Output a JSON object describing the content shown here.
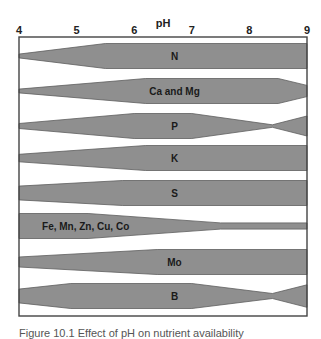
{
  "chart_data": {
    "type": "band",
    "title": "",
    "xlabel": "pH",
    "ylabel": "",
    "xlim": [
      4,
      9
    ],
    "x_ticks": [
      "4",
      "5",
      "6",
      "7",
      "8",
      "9"
    ],
    "grid": false,
    "legend": null,
    "series": [
      {
        "name": "N",
        "label_x": 6.7,
        "profile": [
          [
            4.0,
            0.15
          ],
          [
            5.5,
            1.0
          ],
          [
            9.0,
            1.0
          ]
        ]
      },
      {
        "name": "Ca and Mg",
        "label_x": 6.7,
        "profile": [
          [
            4.0,
            0.15
          ],
          [
            6.2,
            1.0
          ],
          [
            8.5,
            1.0
          ],
          [
            9.0,
            0.45
          ]
        ]
      },
      {
        "name": "P",
        "label_x": 6.7,
        "profile": [
          [
            4.0,
            0.2
          ],
          [
            6.0,
            1.0
          ],
          [
            7.0,
            1.0
          ],
          [
            8.4,
            0.1
          ],
          [
            9.0,
            0.8
          ]
        ]
      },
      {
        "name": "K",
        "label_x": 6.7,
        "profile": [
          [
            4.0,
            0.3
          ],
          [
            6.2,
            1.0
          ],
          [
            9.0,
            1.0
          ]
        ]
      },
      {
        "name": "S",
        "label_x": 6.7,
        "profile": [
          [
            4.0,
            0.55
          ],
          [
            5.8,
            1.0
          ],
          [
            9.0,
            1.0
          ]
        ]
      },
      {
        "name": "Fe, Mn, Zn, Cu, Co",
        "label_x": 4.4,
        "profile": [
          [
            4.0,
            1.0
          ],
          [
            5.2,
            1.0
          ],
          [
            7.5,
            0.25
          ],
          [
            9.0,
            0.25
          ]
        ]
      },
      {
        "name": "Mo",
        "label_x": 6.7,
        "profile": [
          [
            4.0,
            0.4
          ],
          [
            6.4,
            1.0
          ],
          [
            9.0,
            1.0
          ]
        ]
      },
      {
        "name": "B",
        "label_x": 6.7,
        "profile": [
          [
            4.0,
            0.55
          ],
          [
            4.9,
            1.0
          ],
          [
            7.0,
            1.0
          ],
          [
            8.4,
            0.2
          ],
          [
            9.0,
            0.9
          ]
        ]
      }
    ]
  },
  "caption": "Figure 10.1 Effect of pH on nutrient availability"
}
